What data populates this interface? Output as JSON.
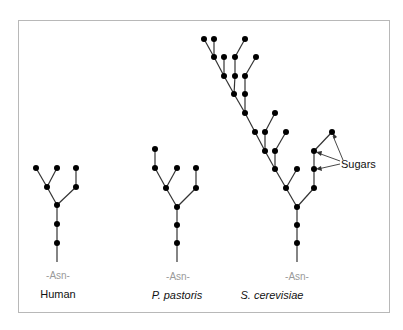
{
  "figure": {
    "organisms": [
      {
        "name": "Human",
        "italic": false,
        "anchor": "-Asn-",
        "label_x": 57,
        "asn_x": 58
      },
      {
        "name": "P. pastoris",
        "italic": true,
        "anchor": "-Asn-",
        "label_x": 177,
        "asn_x": 178
      },
      {
        "name": "S. cerevisiae",
        "italic": true,
        "anchor": "-Asn-",
        "label_x": 272,
        "asn_x": 297
      }
    ],
    "annotation": {
      "label": "Sugars"
    },
    "colors": {
      "node": "#000000",
      "edge": "#333333",
      "anchor_text": "#9a9a9a",
      "border": "#b8b8b8"
    }
  }
}
